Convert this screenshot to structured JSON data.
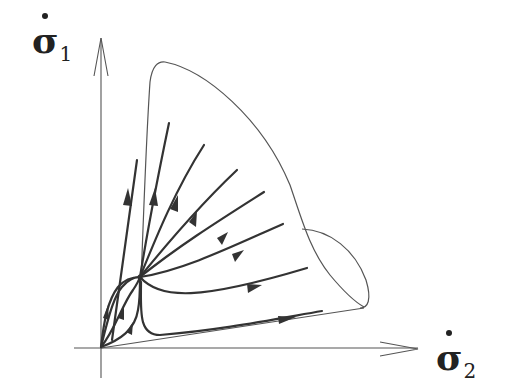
{
  "figure": {
    "type": "phase-portrait",
    "axes": {
      "vertical": {
        "symbol": "σ",
        "subscript": "1",
        "dot": true,
        "text": "σ̇1"
      },
      "horizontal": {
        "symbol": "σ",
        "subscript": "2",
        "dot": true,
        "text": "σ̇2"
      }
    },
    "elements": [
      "horizontal axis arrow",
      "vertical axis arrow",
      "cone-shaped boundary with lobe",
      "node (focal point) with radiating trajectories",
      "trajectories from origin to node"
    ],
    "colors": {
      "line": "#333333",
      "outline": "#555555",
      "background": "#ffffff"
    }
  }
}
